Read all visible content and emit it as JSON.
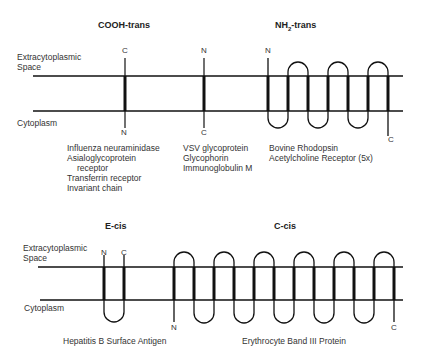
{
  "top": {
    "extracytoplasmic_label": [
      "Extracytoplasmic",
      "Space"
    ],
    "cytoplasm_label": "Cytoplasm",
    "groups": [
      {
        "title": "COOH-trans",
        "terminus_top": "C",
        "terminus_bottom": "N",
        "examples": [
          "Influenza neuraminidase",
          "Asialoglycoprotein",
          "receptor",
          "Transferrin receptor",
          "Invariant chain"
        ]
      },
      {
        "title": "",
        "terminus_top": "N",
        "terminus_bottom": "C",
        "examples": [
          "VSV glycoprotein",
          "Glycophorin",
          "Immunoglobulin M"
        ]
      },
      {
        "title_main": "NH",
        "title_sub": "2",
        "title_rest": "-trans",
        "terminus_top": "N",
        "terminus_bottom": "C",
        "examples": [
          "Bovine Rhodopsin",
          "Acetylcholine Receptor (5x)"
        ]
      }
    ]
  },
  "bottom": {
    "extracytoplasmic_label": [
      "Extracytoplasmic",
      "Space"
    ],
    "cytoplasm_label": "Cytoplasm",
    "groups": [
      {
        "title": "E-cis",
        "terminus_left": "N",
        "terminus_right": "C",
        "examples": [
          "Hepatitis B Surface Antigen"
        ]
      },
      {
        "title": "C-cis",
        "terminus_start": "N",
        "terminus_end": "C",
        "examples": [
          "Erythrocyte Band III Protein"
        ]
      }
    ]
  }
}
